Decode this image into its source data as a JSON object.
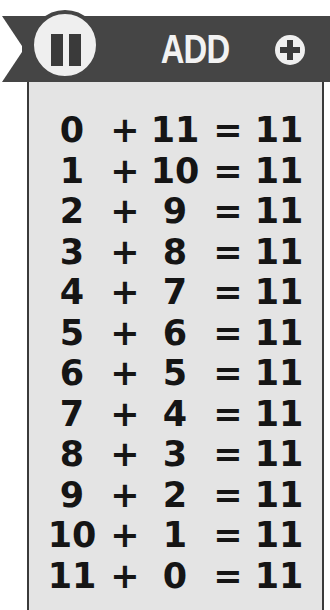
{
  "header": {
    "badge_number": "11",
    "title": "ADD",
    "action_icon": "plus-circle-icon"
  },
  "colors": {
    "banner": "#454545",
    "panel": "#e4e4e4",
    "text": "#151515",
    "title_text": "#f2f2f2"
  },
  "equations": [
    {
      "a": "0",
      "op": "+",
      "b": "11",
      "eq": "=",
      "result": "11"
    },
    {
      "a": "1",
      "op": "+",
      "b": "10",
      "eq": "=",
      "result": "11"
    },
    {
      "a": "2",
      "op": "+",
      "b": "9",
      "eq": "=",
      "result": "11"
    },
    {
      "a": "3",
      "op": "+",
      "b": "8",
      "eq": "=",
      "result": "11"
    },
    {
      "a": "4",
      "op": "+",
      "b": "7",
      "eq": "=",
      "result": "11"
    },
    {
      "a": "5",
      "op": "+",
      "b": "6",
      "eq": "=",
      "result": "11"
    },
    {
      "a": "6",
      "op": "+",
      "b": "5",
      "eq": "=",
      "result": "11"
    },
    {
      "a": "7",
      "op": "+",
      "b": "4",
      "eq": "=",
      "result": "11"
    },
    {
      "a": "8",
      "op": "+",
      "b": "3",
      "eq": "=",
      "result": "11"
    },
    {
      "a": "9",
      "op": "+",
      "b": "2",
      "eq": "=",
      "result": "11"
    },
    {
      "a": "10",
      "op": "+",
      "b": "1",
      "eq": "=",
      "result": "11"
    },
    {
      "a": "11",
      "op": "+",
      "b": "0",
      "eq": "=",
      "result": "11"
    }
  ]
}
